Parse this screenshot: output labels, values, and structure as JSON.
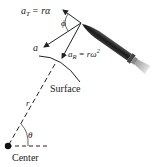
{
  "diagram": {
    "labels": {
      "a_t": "a",
      "a_t_sub": "T",
      "a_t_eq": "= rα",
      "phi": "ϕ",
      "a": "a",
      "a_r": "a",
      "a_r_sub": "R",
      "a_r_eq": "= rω",
      "a_r_sup": "2",
      "surface": "Surface",
      "r": "r",
      "theta": "θ",
      "center": "Center"
    },
    "colors": {
      "ink": "#222222",
      "body": "#2a2a2a",
      "background": "#ffffff"
    }
  }
}
